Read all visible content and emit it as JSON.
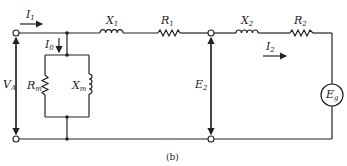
{
  "diagram": {
    "caption": "(b)",
    "labels": {
      "I1": {
        "main": "I",
        "sub": "1"
      },
      "I0": {
        "main": "I",
        "sub": "0"
      },
      "X1": {
        "main": "X",
        "sub": "1"
      },
      "R1": {
        "main": "R",
        "sub": "1"
      },
      "X2": {
        "main": "X",
        "sub": "2"
      },
      "R2": {
        "main": "R",
        "sub": "2"
      },
      "I2": {
        "main": "I",
        "sub": "2"
      },
      "VA": {
        "main": "V",
        "sub": "A"
      },
      "Rm": {
        "main": "R",
        "sub": "m"
      },
      "Xm": {
        "main": "X",
        "sub": "m"
      },
      "E2": {
        "main": "E",
        "sub": "2"
      },
      "Eg": {
        "main": "E",
        "sub": "g"
      }
    },
    "components": [
      {
        "id": "X1",
        "type": "inductor",
        "position": "series-primary"
      },
      {
        "id": "R1",
        "type": "resistor",
        "position": "series-primary"
      },
      {
        "id": "Rm",
        "type": "resistor",
        "position": "shunt"
      },
      {
        "id": "Xm",
        "type": "inductor",
        "position": "shunt"
      },
      {
        "id": "X2",
        "type": "inductor",
        "position": "series-secondary"
      },
      {
        "id": "R2",
        "type": "resistor",
        "position": "series-secondary"
      },
      {
        "id": "Eg",
        "type": "voltage-source",
        "position": "load"
      }
    ],
    "colors": {
      "ink": "#222222",
      "background": "#ffffff"
    }
  }
}
